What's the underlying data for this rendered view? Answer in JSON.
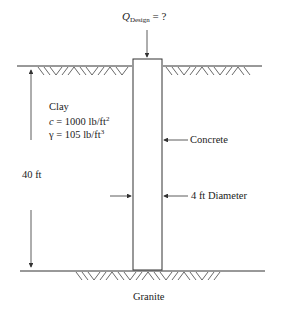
{
  "load": {
    "symbol": "Q",
    "subscript": "Design",
    "suffix": " = ?"
  },
  "soil": {
    "name": "Clay",
    "cohesion_label": "c",
    "cohesion_value": " = 1000 lb/ft",
    "cohesion_exp": "2",
    "unit_weight_label": "γ",
    "unit_weight_value": " = 105 lb/ft",
    "unit_weight_exp": "3"
  },
  "depth_label": "40 ft",
  "pile_material_label": "Concrete",
  "diameter_label": "4 ft Diameter",
  "base_layer_label": "Granite",
  "colors": {
    "line": "#333333",
    "background": "#ffffff"
  }
}
